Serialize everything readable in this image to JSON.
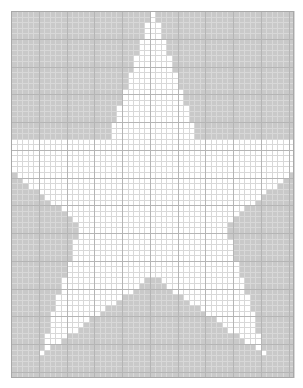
{
  "document": {
    "title": "Rasterized Star Grid",
    "width": 303,
    "height": 388,
    "background_color": "#ffffff"
  },
  "grid": {
    "origin_x": 11,
    "origin_y": 11,
    "width": 283,
    "height": 367,
    "cell_size": 5.55,
    "columns": 51,
    "rows": 66,
    "minor_line_color": "#d8d8d8",
    "major_line_color": "#b5b5b5",
    "major_every": 5,
    "border_color": "#a8a8a8",
    "minor_line_width": 1,
    "major_line_width": 1
  },
  "shape": {
    "name": "five-pointed-star",
    "fill_color": "#ffffff",
    "outside_color": "#c9c9c9",
    "cell_fill_inside": "#ffffff",
    "cell_fill_outside": "#c9c9c9",
    "center_x": 152.5,
    "center_y": 200,
    "outer_radius": 192,
    "inner_radius": 76,
    "rotation_degrees": -90,
    "points": 5,
    "vertices": [
      [
        152.5,
        8
      ],
      [
        175.5,
        122
      ],
      [
        297.0,
        109.0
      ],
      [
        198.0,
        205.0
      ],
      [
        258.0,
        382.0
      ],
      [
        152.5,
        284.0
      ],
      [
        47.0,
        382.0
      ],
      [
        107.0,
        205.0
      ],
      [
        8.0,
        109.0
      ],
      [
        129.5,
        122
      ]
    ],
    "description": "Pixelated five-pointed star: white interior cells on gray exterior cells, aligned to a fine square grid."
  },
  "chart_data": {
    "type": "heatmap",
    "title": "",
    "xlabel": "",
    "ylabel": "",
    "grid": true,
    "legend": false,
    "columns": 51,
    "rows": 66,
    "value_legend": {
      "inside_star": 1,
      "outside_star": 0
    },
    "colors": {
      "1": "#ffffff",
      "0": "#c9c9c9"
    },
    "note": "Binary mask: 1 where the cell center lies inside the five-pointed star polygon, 0 otherwise."
  }
}
